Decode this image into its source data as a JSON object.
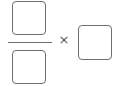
{
  "expression": {
    "numerator": {
      "value": ""
    },
    "denominator": {
      "value": ""
    },
    "operator": "×",
    "factor": {
      "value": ""
    }
  }
}
